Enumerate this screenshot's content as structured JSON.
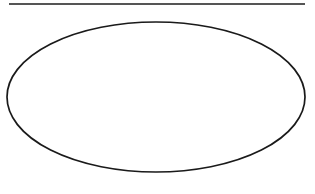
{
  "canvas": {
    "width": 315,
    "height": 194,
    "background_color": "#ffffff"
  },
  "figure": {
    "shapes": [
      {
        "name": "horizontal-rule",
        "type": "line",
        "x1": 9,
        "y1": 4,
        "x2": 305,
        "y2": 4,
        "stroke_color": "#1c1c1c",
        "stroke_width": 1.4
      },
      {
        "name": "ellipse",
        "type": "ellipse",
        "center_x": 156,
        "center_y": 97,
        "radius_x": 149,
        "radius_y": 75,
        "stroke_color": "#1a1a1a",
        "stroke_width": 1.7,
        "fill": "none"
      }
    ]
  }
}
